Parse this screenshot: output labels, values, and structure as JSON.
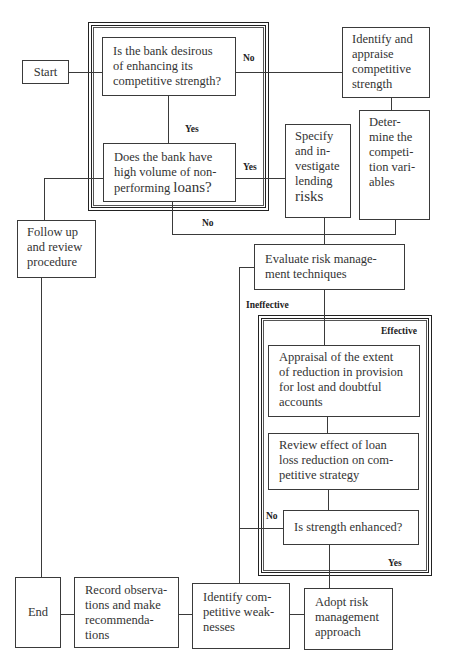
{
  "diagram": {
    "type": "flowchart",
    "header_fragment": "",
    "nodes": {
      "start": "Start",
      "q_desirous": "Is the bank desirous\nof enhancing its\ncompetitive strength?",
      "identify_appraise": "Identify and\nappraise\ncompetitive\nstrength",
      "determine_vars": "Deter-\nmine the\ncompeti-\ntion vari-\nables",
      "q_nonperforming_a": "Does the bank have\nhigh volume of non-\nperforming ",
      "q_nonperforming_b": "loans?",
      "specify_risks_a": "Specify\nand in-\nvestigate\nlending",
      "specify_risks_b": "risks",
      "follow_up": "Follow up\nand review\nprocedure",
      "evaluate": "Evaluate risk manage-\nment techniques",
      "appraisal": "Appraisal of the extent\nof reduction in provision\nfor lost and doubtful\naccounts",
      "review_effect": "Review effect of loan\nloss reduction on com-\npetitive strategy",
      "q_strength": "Is strength enhanced?",
      "end": "End",
      "record": "Record observa-\ntions and make\nrecommenda-\ntions",
      "identify_weak": "Identify com-\npetitive weak-\nnesses",
      "adopt": "Adopt risk\nmanagement\napproach"
    },
    "edge_labels": {
      "no_1": "No",
      "yes_1": "Yes",
      "yes_2": "Yes",
      "no_2": "No",
      "ineffective": "Ineffective",
      "effective": "Effective",
      "no_3": "No",
      "yes_3": "Yes"
    },
    "colors": {
      "line": "#3a3a3a",
      "text": "#333333",
      "background": "#ffffff"
    }
  }
}
